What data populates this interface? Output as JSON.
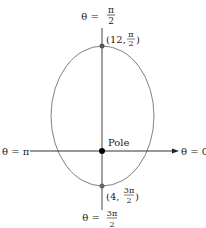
{
  "diagram": {
    "type": "polar-graph",
    "curve": "ellipse",
    "axes": {
      "top_label_lhs": "θ =",
      "top_label_num": "π",
      "top_label_den": "2",
      "bottom_label_lhs": "θ =",
      "bottom_label_num": "3π",
      "bottom_label_den": "2",
      "left_label": "θ = π",
      "right_label": "θ = 0"
    },
    "pole_label": "Pole",
    "points": [
      {
        "r": "12",
        "theta_num": "π",
        "theta_den": "2",
        "label_prefix": "(12,",
        "label_suffix": ")"
      },
      {
        "r": "4",
        "theta_num": "3π",
        "theta_den": "2",
        "label_prefix": "(4,",
        "label_suffix": ")"
      }
    ],
    "colors": {
      "curve": "#808080",
      "axis": "#333333",
      "pole": "#000000",
      "point": "#555555"
    }
  }
}
